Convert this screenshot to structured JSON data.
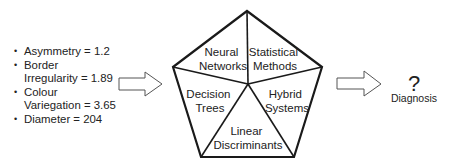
{
  "features": [
    {
      "bullet": "•",
      "lines": [
        "Asymmetry = 1.2"
      ]
    },
    {
      "bullet": "•",
      "lines": [
        "Border",
        "Irregularity = 1.89"
      ]
    },
    {
      "bullet": "•",
      "lines": [
        "Colour",
        "Variegation = 3.65"
      ]
    },
    {
      "bullet": "•",
      "lines": [
        "Diameter = 204"
      ]
    }
  ],
  "pentagon": {
    "segments": {
      "neural_networks": [
        "Neural",
        "Networks"
      ],
      "statistical_methods": [
        "Statistical",
        "Methods"
      ],
      "decision_trees": [
        "Decision",
        "Trees"
      ],
      "hybrid_systems": [
        "Hybrid",
        "Systems"
      ],
      "linear_discriminants": [
        "Linear",
        "Discriminants"
      ]
    }
  },
  "output": {
    "symbol": "?",
    "label": "Diagnosis"
  },
  "colors": {
    "stroke": "#1a1a1a",
    "arrow_stroke": "#555555",
    "text": "#222222"
  }
}
